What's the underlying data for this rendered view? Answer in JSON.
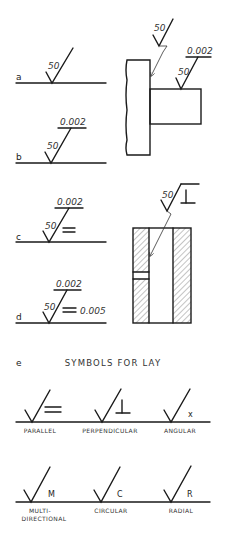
{
  "figure": {
    "examples": [
      {
        "letter": "a",
        "roughness": "50",
        "waviness_height": "",
        "lay": "",
        "waviness_width": ""
      },
      {
        "letter": "b",
        "roughness": "50",
        "waviness_height": "0.002",
        "lay": "",
        "waviness_width": ""
      },
      {
        "letter": "c",
        "roughness": "50",
        "waviness_height": "0.002",
        "lay": "=",
        "waviness_width": ""
      },
      {
        "letter": "d",
        "roughness": "50",
        "waviness_height": "0.002",
        "lay": "=",
        "waviness_width": "0.005"
      }
    ],
    "part1": {
      "callout_top": "50",
      "callout_side_roughness": "50",
      "callout_side_waviness": "0.002"
    },
    "part2": {
      "callout_roughness": "50",
      "callout_lay": "⊥"
    },
    "section_e": {
      "letter": "e",
      "title": "SYMBOLS FOR LAY",
      "symbols": [
        {
          "glyph": "=",
          "label": "PARALLEL"
        },
        {
          "glyph": "⊥",
          "label": "PERPENDICULAR"
        },
        {
          "glyph": "X",
          "label": "ANGULAR"
        },
        {
          "glyph": "M",
          "label": "MULTI-",
          "label2": "DIRECTIONAL"
        },
        {
          "glyph": "C",
          "label": "CIRCULAR"
        },
        {
          "glyph": "R",
          "label": "RADIAL"
        }
      ]
    }
  }
}
